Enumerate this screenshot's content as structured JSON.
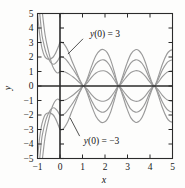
{
  "figure": {
    "background_color": "#fdfdfc",
    "frame_color": "#2b2b2b",
    "axis_color": "#2b2b2b",
    "curve_color": "#9a9a9a",
    "curve_color_dark": "#8a8a8a"
  },
  "axes": {
    "x_title": "x",
    "y_title": "y",
    "x_ticks": [
      "-1",
      "0",
      "1",
      "2",
      "3",
      "4",
      "5"
    ],
    "y_ticks": [
      "5",
      "4",
      "3",
      "2",
      "1",
      "0",
      "-1",
      "-2",
      "-3",
      "-4",
      "-5"
    ]
  },
  "annotations": [
    {
      "name": "upper-label",
      "text_prefix": "y",
      "text": "y(0) = 3"
    },
    {
      "name": "lower-label",
      "text_prefix": "y",
      "text": "y(0) = −3"
    }
  ],
  "chart_data": {
    "type": "line",
    "title": "",
    "xlabel": "x",
    "ylabel": "y",
    "xlim": [
      -1,
      5
    ],
    "ylim": [
      -5,
      5
    ],
    "xticks": [
      -1,
      0,
      1,
      2,
      3,
      4,
      5
    ],
    "yticks": [
      -5,
      -4,
      -3,
      -2,
      -1,
      0,
      1,
      2,
      3,
      4,
      5
    ],
    "grid": false,
    "legend": "none",
    "annotations": [
      {
        "label": "y(0) = 3",
        "x": 2.0,
        "y": 3.6,
        "points_to_x": 0.35,
        "points_to_y": 2.2
      },
      {
        "label": "y(0) = -3",
        "x": 1.85,
        "y": -3.8,
        "points_to_x": 0.45,
        "points_to_y": -2.2
      }
    ],
    "nodes_x": [
      1.05,
      2.62,
      4.2
    ],
    "series": [
      {
        "name": "y(0) = 3 (upper outer)",
        "initial_value": 3,
        "peak_amplitudes": [
          2.5,
          2.5,
          2.5
        ],
        "points": [
          [
            -1.0,
            5.0
          ],
          [
            -0.95,
            4.2
          ],
          [
            -0.9,
            3.5
          ],
          [
            -0.85,
            3.0
          ],
          [
            -0.8,
            2.6
          ],
          [
            -0.7,
            2.1
          ],
          [
            -0.6,
            1.9
          ],
          [
            -0.45,
            1.85
          ],
          [
            -0.3,
            2.0
          ],
          [
            -0.2,
            2.25
          ],
          [
            -0.1,
            2.6
          ],
          [
            -0.05,
            2.8
          ],
          [
            0.0,
            3.0
          ],
          [
            0.1,
            3.0
          ],
          [
            0.2,
            2.85
          ],
          [
            0.35,
            2.45
          ],
          [
            0.5,
            1.85
          ],
          [
            0.7,
            1.1
          ],
          [
            0.9,
            0.35
          ],
          [
            1.05,
            0.0
          ],
          [
            1.2,
            0.45
          ],
          [
            1.4,
            1.35
          ],
          [
            1.6,
            2.1
          ],
          [
            1.8,
            2.48
          ],
          [
            1.95,
            2.5
          ],
          [
            2.1,
            2.3
          ],
          [
            2.25,
            1.8
          ],
          [
            2.4,
            1.05
          ],
          [
            2.55,
            0.2
          ],
          [
            2.62,
            0.0
          ],
          [
            2.75,
            0.5
          ],
          [
            2.95,
            1.45
          ],
          [
            3.15,
            2.2
          ],
          [
            3.35,
            2.5
          ],
          [
            3.5,
            2.45
          ],
          [
            3.65,
            2.15
          ],
          [
            3.8,
            1.6
          ],
          [
            3.95,
            0.85
          ],
          [
            4.1,
            0.2
          ],
          [
            4.2,
            0.0
          ],
          [
            4.35,
            0.55
          ],
          [
            4.55,
            1.5
          ],
          [
            4.75,
            2.2
          ],
          [
            4.9,
            2.45
          ],
          [
            5.0,
            2.5
          ]
        ]
      },
      {
        "name": "y(0) = 3 (middle)",
        "initial_value": 2,
        "peak_amplitudes": [
          1.8,
          1.8,
          1.8
        ],
        "points": [
          [
            -0.9,
            5.0
          ],
          [
            -0.85,
            4.2
          ],
          [
            -0.8,
            3.5
          ],
          [
            -0.72,
            2.9
          ],
          [
            -0.62,
            2.3
          ],
          [
            -0.5,
            1.85
          ],
          [
            -0.4,
            1.6
          ],
          [
            -0.28,
            1.5
          ],
          [
            -0.18,
            1.6
          ],
          [
            -0.1,
            1.75
          ],
          [
            -0.05,
            1.9
          ],
          [
            0.0,
            2.0
          ],
          [
            0.1,
            2.0
          ],
          [
            0.25,
            1.85
          ],
          [
            0.4,
            1.55
          ],
          [
            0.6,
            1.1
          ],
          [
            0.8,
            0.6
          ],
          [
            0.95,
            0.2
          ],
          [
            1.05,
            0.0
          ],
          [
            1.2,
            0.35
          ],
          [
            1.4,
            1.0
          ],
          [
            1.6,
            1.55
          ],
          [
            1.8,
            1.78
          ],
          [
            1.95,
            1.8
          ],
          [
            2.1,
            1.65
          ],
          [
            2.25,
            1.3
          ],
          [
            2.4,
            0.75
          ],
          [
            2.55,
            0.15
          ],
          [
            2.62,
            0.0
          ],
          [
            2.75,
            0.38
          ],
          [
            2.95,
            1.05
          ],
          [
            3.15,
            1.6
          ],
          [
            3.35,
            1.8
          ],
          [
            3.5,
            1.76
          ],
          [
            3.65,
            1.55
          ],
          [
            3.8,
            1.15
          ],
          [
            3.95,
            0.6
          ],
          [
            4.1,
            0.15
          ],
          [
            4.2,
            0.0
          ],
          [
            4.35,
            0.4
          ],
          [
            4.55,
            1.1
          ],
          [
            4.75,
            1.6
          ],
          [
            4.9,
            1.76
          ],
          [
            5.0,
            1.8
          ]
        ]
      },
      {
        "name": "y(0) = 3 (inner)",
        "initial_value": 1,
        "peak_amplitudes": [
          1.05,
          1.05,
          1.05
        ],
        "points": [
          [
            -0.78,
            5.0
          ],
          [
            -0.72,
            4.2
          ],
          [
            -0.66,
            3.5
          ],
          [
            -0.58,
            2.85
          ],
          [
            -0.48,
            2.2
          ],
          [
            -0.38,
            1.6
          ],
          [
            -0.28,
            1.2
          ],
          [
            -0.18,
            0.98
          ],
          [
            -0.1,
            0.9
          ],
          [
            -0.04,
            0.95
          ],
          [
            0.0,
            1.0
          ],
          [
            0.1,
            1.0
          ],
          [
            0.25,
            0.95
          ],
          [
            0.4,
            0.82
          ],
          [
            0.6,
            0.6
          ],
          [
            0.8,
            0.33
          ],
          [
            0.95,
            0.1
          ],
          [
            1.05,
            0.0
          ],
          [
            1.2,
            0.2
          ],
          [
            1.4,
            0.6
          ],
          [
            1.6,
            0.9
          ],
          [
            1.8,
            1.03
          ],
          [
            1.95,
            1.05
          ],
          [
            2.1,
            0.97
          ],
          [
            2.25,
            0.76
          ],
          [
            2.4,
            0.45
          ],
          [
            2.55,
            0.08
          ],
          [
            2.62,
            0.0
          ],
          [
            2.75,
            0.22
          ],
          [
            2.95,
            0.62
          ],
          [
            3.15,
            0.93
          ],
          [
            3.35,
            1.05
          ],
          [
            3.5,
            1.03
          ],
          [
            3.65,
            0.9
          ],
          [
            3.8,
            0.66
          ],
          [
            3.95,
            0.35
          ],
          [
            4.1,
            0.08
          ],
          [
            4.2,
            0.0
          ],
          [
            4.35,
            0.23
          ],
          [
            4.55,
            0.64
          ],
          [
            4.75,
            0.94
          ],
          [
            4.9,
            1.03
          ],
          [
            5.0,
            1.05
          ]
        ]
      },
      {
        "name": "y(0) = -3 (lower outer)",
        "initial_value": -3,
        "peak_amplitudes": [
          -2.5,
          -2.5,
          -2.5
        ],
        "points": [
          [
            -1.0,
            -5.0
          ],
          [
            -0.95,
            -4.2
          ],
          [
            -0.9,
            -3.5
          ],
          [
            -0.85,
            -3.0
          ],
          [
            -0.8,
            -2.6
          ],
          [
            -0.7,
            -2.1
          ],
          [
            -0.6,
            -1.9
          ],
          [
            -0.45,
            -1.85
          ],
          [
            -0.3,
            -2.0
          ],
          [
            -0.2,
            -2.25
          ],
          [
            -0.1,
            -2.6
          ],
          [
            -0.05,
            -2.8
          ],
          [
            0.0,
            -3.0
          ],
          [
            0.1,
            -3.0
          ],
          [
            0.2,
            -2.85
          ],
          [
            0.35,
            -2.45
          ],
          [
            0.5,
            -1.85
          ],
          [
            0.7,
            -1.1
          ],
          [
            0.9,
            -0.35
          ],
          [
            1.05,
            0.0
          ],
          [
            1.2,
            -0.45
          ],
          [
            1.4,
            -1.35
          ],
          [
            1.6,
            -2.1
          ],
          [
            1.8,
            -2.48
          ],
          [
            1.95,
            -2.5
          ],
          [
            2.1,
            -2.3
          ],
          [
            2.25,
            -1.8
          ],
          [
            2.4,
            -1.05
          ],
          [
            2.55,
            -0.2
          ],
          [
            2.62,
            0.0
          ],
          [
            2.75,
            -0.5
          ],
          [
            2.95,
            -1.45
          ],
          [
            3.15,
            -2.2
          ],
          [
            3.35,
            -2.5
          ],
          [
            3.5,
            -2.45
          ],
          [
            3.65,
            -2.15
          ],
          [
            3.8,
            -1.6
          ],
          [
            3.95,
            -0.85
          ],
          [
            4.1,
            -0.2
          ],
          [
            4.2,
            0.0
          ],
          [
            4.35,
            -0.55
          ],
          [
            4.55,
            -1.5
          ],
          [
            4.75,
            -2.2
          ],
          [
            4.9,
            -2.45
          ],
          [
            5.0,
            -2.5
          ]
        ]
      },
      {
        "name": "y(0) = -3 (middle)",
        "initial_value": -2,
        "peak_amplitudes": [
          -1.8,
          -1.8,
          -1.8
        ],
        "points": [
          [
            -0.9,
            -5.0
          ],
          [
            -0.85,
            -4.2
          ],
          [
            -0.8,
            -3.5
          ],
          [
            -0.72,
            -2.9
          ],
          [
            -0.62,
            -2.3
          ],
          [
            -0.5,
            -1.85
          ],
          [
            -0.4,
            -1.6
          ],
          [
            -0.28,
            -1.5
          ],
          [
            -0.18,
            -1.6
          ],
          [
            -0.1,
            -1.75
          ],
          [
            -0.05,
            -1.9
          ],
          [
            0.0,
            -2.0
          ],
          [
            0.1,
            -2.0
          ],
          [
            0.25,
            -1.85
          ],
          [
            0.4,
            -1.55
          ],
          [
            0.6,
            -1.1
          ],
          [
            0.8,
            -0.6
          ],
          [
            0.95,
            -0.2
          ],
          [
            1.05,
            0.0
          ],
          [
            1.2,
            -0.35
          ],
          [
            1.4,
            -1.0
          ],
          [
            1.6,
            -1.55
          ],
          [
            1.8,
            -1.78
          ],
          [
            1.95,
            -1.8
          ],
          [
            2.1,
            -1.65
          ],
          [
            2.25,
            -1.3
          ],
          [
            2.4,
            -0.75
          ],
          [
            2.55,
            -0.15
          ],
          [
            2.62,
            0.0
          ],
          [
            2.75,
            -0.38
          ],
          [
            2.95,
            -1.05
          ],
          [
            3.15,
            -1.6
          ],
          [
            3.35,
            -1.8
          ],
          [
            3.5,
            -1.76
          ],
          [
            3.65,
            -1.55
          ],
          [
            3.8,
            -1.15
          ],
          [
            3.95,
            -0.6
          ],
          [
            4.1,
            -0.15
          ],
          [
            4.2,
            0.0
          ],
          [
            4.35,
            -0.4
          ],
          [
            4.55,
            -1.1
          ],
          [
            4.75,
            -1.6
          ],
          [
            4.9,
            -1.76
          ],
          [
            5.0,
            -1.8
          ]
        ]
      },
      {
        "name": "y(0) = -3 (inner)",
        "initial_value": -1,
        "peak_amplitudes": [
          -1.05,
          -1.05,
          -1.05
        ],
        "points": [
          [
            -0.78,
            -5.0
          ],
          [
            -0.72,
            -4.2
          ],
          [
            -0.66,
            -3.5
          ],
          [
            -0.58,
            -2.85
          ],
          [
            -0.48,
            -2.2
          ],
          [
            -0.38,
            -1.6
          ],
          [
            -0.28,
            -1.2
          ],
          [
            -0.18,
            -0.98
          ],
          [
            -0.1,
            -0.9
          ],
          [
            -0.04,
            -0.95
          ],
          [
            0.0,
            -1.0
          ],
          [
            0.1,
            -1.0
          ],
          [
            0.25,
            -0.95
          ],
          [
            0.4,
            -0.82
          ],
          [
            0.6,
            -0.6
          ],
          [
            0.8,
            -0.33
          ],
          [
            0.95,
            -0.1
          ],
          [
            1.05,
            0.0
          ],
          [
            1.2,
            -0.2
          ],
          [
            1.4,
            -0.6
          ],
          [
            1.6,
            -0.9
          ],
          [
            1.8,
            -1.03
          ],
          [
            1.95,
            -1.05
          ],
          [
            2.1,
            -0.97
          ],
          [
            2.25,
            -0.76
          ],
          [
            2.4,
            -0.45
          ],
          [
            2.55,
            -0.08
          ],
          [
            2.62,
            0.0
          ],
          [
            2.75,
            -0.22
          ],
          [
            2.95,
            -0.62
          ],
          [
            3.15,
            -0.93
          ],
          [
            3.35,
            -1.05
          ],
          [
            3.5,
            -1.03
          ],
          [
            3.65,
            -0.9
          ],
          [
            3.8,
            -0.66
          ],
          [
            3.95,
            -0.35
          ],
          [
            4.1,
            -0.08
          ],
          [
            4.2,
            0.0
          ],
          [
            4.35,
            -0.23
          ],
          [
            4.55,
            -0.64
          ],
          [
            4.75,
            -0.94
          ],
          [
            4.9,
            -1.03
          ],
          [
            5.0,
            -1.05
          ]
        ]
      }
    ]
  }
}
